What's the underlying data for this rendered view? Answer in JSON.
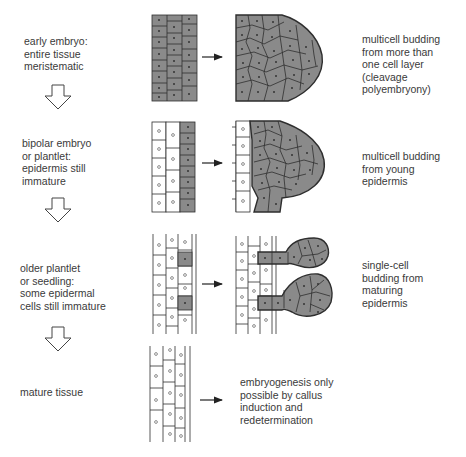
{
  "stages": [
    {
      "label": "early embryo:\nentire tissue\nmeristematic",
      "result": "multicell budding\nfrom more than\none cell layer\n(cleavage\npolyembryony)"
    },
    {
      "label": "bipolar embryo\nor plantlet:\nepidermis still\nimmature",
      "result": "multicell budding\nfrom young\nepidermis"
    },
    {
      "label": "older plantlet\nor seedling:\nsome epidermal\ncells still immature",
      "result": "single-cell\nbudding from\nmaturing\nepidermis"
    },
    {
      "label": "mature tissue",
      "result": "embryogenesis only\npossible by callus\ninduction and\nredetermination"
    }
  ],
  "colors": {
    "meristematic_cell": "#8a8a8a",
    "mature_cell": "#ffffff",
    "outline": "#2e2e2e",
    "text": "#3a3a3a"
  }
}
